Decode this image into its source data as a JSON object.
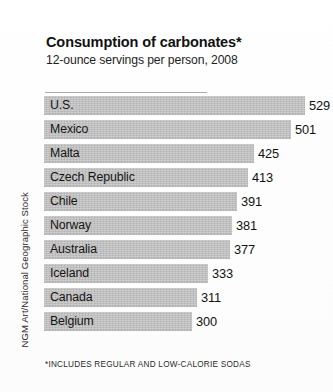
{
  "credit": "NGM Art/National Geographic Stock",
  "header": {
    "title": "Consumption of carbonates*",
    "subtitle": "12-ounce servings per person, 2008"
  },
  "footnote": "*INCLUDES REGULAR AND LOW-CALORIE SODAS",
  "colors": {
    "bar_fill": "#bfbfbf",
    "text": "#151515",
    "rule": "#a9a9a9",
    "background": "#fdfdfd"
  },
  "chart_data": {
    "type": "bar",
    "orientation": "horizontal",
    "title": "Consumption of carbonates*",
    "subtitle": "12-ounce servings per person, 2008",
    "xlabel": "",
    "ylabel": "",
    "unit": "12-ounce servings per person",
    "year": 2008,
    "grid": false,
    "legend": null,
    "xlim": [
      0,
      529
    ],
    "categories": [
      "U.S.",
      "Mexico",
      "Malta",
      "Czech Republic",
      "Chile",
      "Norway",
      "Australia",
      "Iceland",
      "Canada",
      "Belgium"
    ],
    "values": [
      529,
      501,
      425,
      413,
      391,
      381,
      377,
      333,
      311,
      300
    ],
    "data_labels": [
      "529",
      "501",
      "425",
      "413",
      "391",
      "381",
      "377",
      "333",
      "311",
      "300"
    ],
    "annotations": [
      "*INCLUDES REGULAR AND LOW-CALORIE SODAS"
    ],
    "credit": "NGM Art/National Geographic Stock"
  }
}
